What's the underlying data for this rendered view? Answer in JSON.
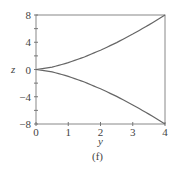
{
  "chart_data": {
    "type": "line",
    "title": "",
    "caption": "(f)",
    "xlabel": "y",
    "ylabel": "z",
    "xlim": [
      0,
      4
    ],
    "ylim": [
      -8,
      8
    ],
    "grid": false,
    "x_ticks": [
      0,
      1,
      2,
      3,
      4
    ],
    "x_tick_labels": [
      "0",
      "1",
      "2",
      "3",
      "4"
    ],
    "y_ticks": [
      8,
      4,
      0,
      -4,
      -8
    ],
    "y_tick_labels": [
      "8",
      "4",
      "0",
      "−4",
      "−8"
    ],
    "y_minor_ticks": [
      6,
      2,
      -2,
      -6
    ],
    "series": [
      {
        "name": "upper",
        "x": [
          0,
          0.5,
          1,
          1.5,
          2,
          2.5,
          3,
          3.5,
          4
        ],
        "values": [
          0,
          0.35,
          1,
          1.84,
          2.83,
          3.95,
          5.2,
          6.55,
          8
        ]
      },
      {
        "name": "lower",
        "x": [
          0,
          0.5,
          1,
          1.5,
          2,
          2.5,
          3,
          3.5,
          4
        ],
        "values": [
          0,
          -0.35,
          -1,
          -1.84,
          -2.83,
          -3.95,
          -5.2,
          -6.55,
          -8
        ]
      }
    ],
    "line_color": "#666666"
  }
}
